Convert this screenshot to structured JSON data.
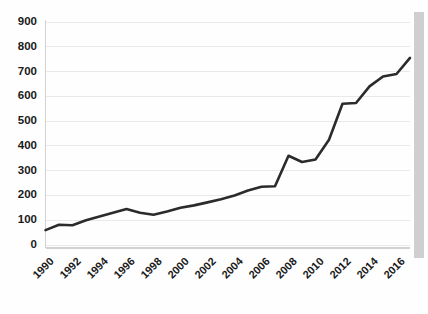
{
  "chart_data": {
    "type": "line",
    "title": "",
    "subtitle": "",
    "xlabel": "",
    "ylabel": "",
    "grid": "horizontal",
    "legend": "none",
    "line_color": "#2b2b2b",
    "gridline_color": "#e9e9e9",
    "background_color": "#fefefe",
    "ylim": [
      0,
      900
    ],
    "ytick_labels": [
      "900",
      "800",
      "700",
      "600",
      "500",
      "400",
      "300",
      "200",
      "100",
      "0"
    ],
    "ytick_values": [
      900,
      800,
      700,
      600,
      500,
      400,
      300,
      200,
      100,
      0
    ],
    "xlim": [
      1990,
      2017
    ],
    "xtick_labels": [
      "1990",
      "1992",
      "1994",
      "1996",
      "1998",
      "2000",
      "2002",
      "2004",
      "2006",
      "2008",
      "2010",
      "2012",
      "2014",
      "2016"
    ],
    "xtick_values": [
      1990,
      1992,
      1994,
      1996,
      1998,
      2000,
      2002,
      2004,
      2006,
      2008,
      2010,
      2012,
      2014,
      2016
    ],
    "x": [
      1990,
      1991,
      1992,
      1993,
      1994,
      1995,
      1996,
      1997,
      1998,
      1999,
      2000,
      2001,
      2002,
      2003,
      2004,
      2005,
      2006,
      2007,
      2008,
      2009,
      2010,
      2011,
      2012,
      2013,
      2014,
      2015,
      2016,
      2017
    ],
    "values": [
      60,
      82,
      80,
      100,
      115,
      130,
      145,
      130,
      122,
      135,
      150,
      160,
      172,
      185,
      200,
      220,
      235,
      237,
      360,
      335,
      345,
      425,
      570,
      573,
      640,
      680,
      690,
      755
    ]
  },
  "scrollbar": {
    "name": "vertical-scrollbar"
  }
}
